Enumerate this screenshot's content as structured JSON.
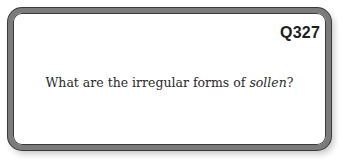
{
  "card": {
    "number": "Q327",
    "question_prefix": "What are the irregular forms of ",
    "question_emphasis": "sollen",
    "question_suffix": "?"
  }
}
